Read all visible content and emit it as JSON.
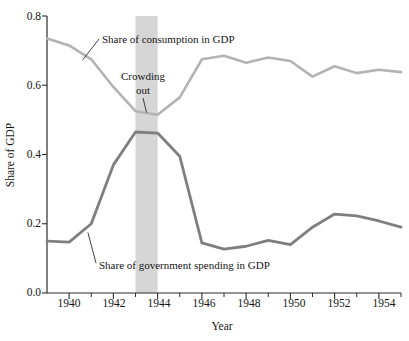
{
  "chart_data": {
    "type": "line",
    "title": "",
    "xlabel": "Year",
    "ylabel": "Share of GDP",
    "xlim": [
      1939,
      1955
    ],
    "ylim": [
      0.0,
      0.8
    ],
    "grid": false,
    "legend_position": "inline-annotations",
    "x": [
      1939,
      1940,
      1941,
      1942,
      1943,
      1944,
      1945,
      1946,
      1947,
      1948,
      1949,
      1950,
      1951,
      1952,
      1953,
      1954,
      1955
    ],
    "xticks_major": [
      "1940",
      "1942",
      "1944",
      "1946",
      "1948",
      "1950",
      "1952",
      "1954"
    ],
    "xticks_minor": [
      "1941",
      "1943",
      "1945",
      "1947",
      "1949",
      "1951",
      "1953",
      "1955"
    ],
    "yticks": [
      "0.0",
      "0.2",
      "0.4",
      "0.6",
      "0.8"
    ],
    "series": [
      {
        "name": "Share of consumption in GDP",
        "color": "#b3b3b3",
        "values": [
          0.735,
          0.715,
          0.675,
          0.595,
          0.525,
          0.515,
          0.565,
          0.675,
          0.685,
          0.665,
          0.68,
          0.67,
          0.625,
          0.655,
          0.635,
          0.645,
          0.638
        ]
      },
      {
        "name": "Share of government spending in GDP",
        "color": "#7f7f7f",
        "values": [
          0.15,
          0.147,
          0.2,
          0.37,
          0.465,
          0.462,
          0.395,
          0.145,
          0.127,
          0.135,
          0.152,
          0.14,
          0.19,
          0.228,
          0.223,
          0.208,
          0.19
        ]
      }
    ],
    "shaded_band": {
      "label": "Crowding out",
      "from": 1943,
      "to": 1944,
      "color": "#d6d6d6"
    },
    "annotations": [
      {
        "text": "Share of consumption in GDP",
        "target_year": 1940.6,
        "target_value": 0.672
      },
      {
        "text": "Crowding out",
        "target_year": 1943.5,
        "target_value": 0.515
      },
      {
        "text": "Share of government spending in GDP",
        "target_year": 1940.85,
        "target_value": 0.175
      }
    ]
  },
  "labels": {
    "y_axis_title": "Share of GDP",
    "x_axis_title": "Year",
    "annotation_consumption": "Share of consumption in GDP",
    "annotation_crowding_line1": "Crowding",
    "annotation_crowding_line2": "out",
    "annotation_government": "Share of government spending in GDP",
    "ytick_0": "0.0",
    "ytick_1": "0.2",
    "ytick_2": "0.4",
    "ytick_3": "0.6",
    "ytick_4": "0.8",
    "xtick_0": "1940",
    "xtick_1": "1942",
    "xtick_2": "1944",
    "xtick_3": "1946",
    "xtick_4": "1948",
    "xtick_5": "1950",
    "xtick_6": "1952",
    "xtick_7": "1954"
  }
}
